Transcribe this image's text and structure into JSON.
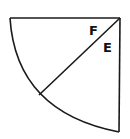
{
  "diagram": {
    "type": "quarter-circle sector split by a radius",
    "stroke_color": "#1a1a1a",
    "labels": {
      "angle_upper": "F",
      "angle_lower": "E"
    }
  }
}
